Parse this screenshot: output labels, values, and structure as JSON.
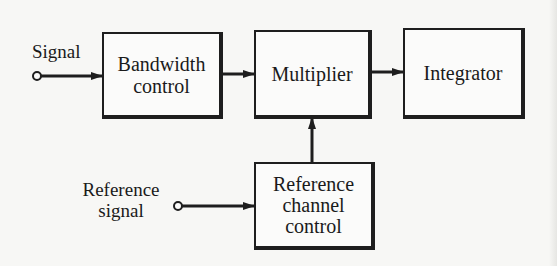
{
  "diagram": {
    "type": "block-diagram",
    "inputs": [
      {
        "id": "signal",
        "label": "Signal",
        "terminal": "open-circle"
      },
      {
        "id": "reference_signal",
        "label_lines": [
          "Reference",
          "signal"
        ],
        "terminal": "open-circle"
      }
    ],
    "blocks": [
      {
        "id": "bandwidth_control",
        "lines": [
          "Bandwidth",
          "control"
        ]
      },
      {
        "id": "multiplier",
        "lines": [
          "Multiplier"
        ]
      },
      {
        "id": "integrator",
        "lines": [
          "Integrator"
        ]
      },
      {
        "id": "reference_channel_control",
        "lines": [
          "Reference",
          "channel",
          "control"
        ]
      }
    ],
    "connections": [
      {
        "from": "signal",
        "to": "bandwidth_control"
      },
      {
        "from": "bandwidth_control",
        "to": "multiplier"
      },
      {
        "from": "multiplier",
        "to": "integrator"
      },
      {
        "from": "reference_signal",
        "to": "reference_channel_control"
      },
      {
        "from": "reference_channel_control",
        "to": "multiplier"
      }
    ],
    "colors": {
      "background": "#f7f7f5",
      "line": "#1e1e1e",
      "text": "#1a1a1a"
    }
  }
}
